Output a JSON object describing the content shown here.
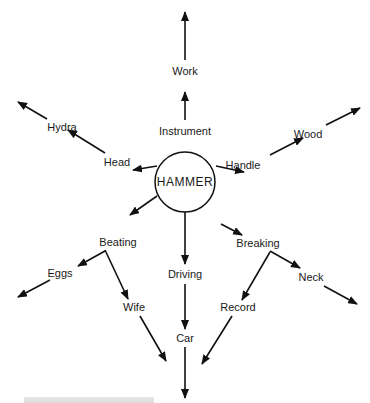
{
  "diagram": {
    "center": {
      "label": "HAMMER",
      "x": 185,
      "y": 182,
      "r": 30
    },
    "nodes": [
      {
        "id": "work",
        "label": "Work",
        "x": 185,
        "y": 71
      },
      {
        "id": "instrument",
        "label": "Instrument",
        "x": 185,
        "y": 131
      },
      {
        "id": "hydra",
        "label": "Hydra",
        "x": 62,
        "y": 127
      },
      {
        "id": "head",
        "label": "Head",
        "x": 117,
        "y": 162
      },
      {
        "id": "handle",
        "label": "Handle",
        "x": 243,
        "y": 165
      },
      {
        "id": "wood",
        "label": "Wood",
        "x": 308,
        "y": 134
      },
      {
        "id": "beating",
        "label": "Beating",
        "x": 118,
        "y": 242
      },
      {
        "id": "eggs",
        "label": "Eggs",
        "x": 60,
        "y": 273
      },
      {
        "id": "wife",
        "label": "Wife",
        "x": 134,
        "y": 307
      },
      {
        "id": "driving",
        "label": "Driving",
        "x": 185,
        "y": 274
      },
      {
        "id": "car",
        "label": "Car",
        "x": 185,
        "y": 338
      },
      {
        "id": "breaking",
        "label": "Breaking",
        "x": 258,
        "y": 243
      },
      {
        "id": "neck",
        "label": "Neck",
        "x": 311,
        "y": 277
      },
      {
        "id": "record",
        "label": "Record",
        "x": 238,
        "y": 307
      }
    ],
    "arrows": [
      [
        185,
        120,
        185,
        92
      ],
      [
        185,
        60,
        185,
        12
      ],
      [
        157,
        166,
        133,
        170
      ],
      [
        105,
        153,
        68,
        130
      ],
      [
        47,
        119,
        18,
        102
      ],
      [
        216,
        166,
        244,
        172
      ],
      [
        270,
        155,
        303,
        138
      ],
      [
        326,
        125,
        360,
        108
      ],
      [
        157,
        196,
        130,
        215
      ],
      [
        105,
        251,
        78,
        266
      ],
      [
        50,
        280,
        18,
        297
      ],
      [
        105,
        250,
        128,
        299
      ],
      [
        140,
        316,
        166,
        361
      ],
      [
        185,
        212,
        185,
        264
      ],
      [
        185,
        284,
        185,
        329
      ],
      [
        185,
        347,
        185,
        398
      ],
      [
        221,
        224,
        242,
        235
      ],
      [
        270,
        251,
        300,
        268
      ],
      [
        324,
        286,
        357,
        304
      ],
      [
        270,
        252,
        242,
        300
      ],
      [
        232,
        316,
        202,
        364
      ]
    ],
    "caption": ""
  }
}
